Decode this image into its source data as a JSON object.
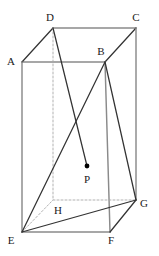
{
  "figure": {
    "type": "geometry-diagram",
    "shape": "rectangular-prism",
    "title": "",
    "canvas": {
      "width": 159,
      "height": 256
    },
    "colors": {
      "solid_edge": "#333333",
      "light_edge": "#8a8a8a",
      "hidden_edge": "#a8a8a8",
      "label_text": "#1a1a1a",
      "background": "#ffffff",
      "point_marker": "#000000"
    },
    "vertices": [
      {
        "name": "A",
        "label": "A",
        "x": 22,
        "y": 62,
        "label_x": 11,
        "label_y": 62,
        "hidden": false
      },
      {
        "name": "B",
        "label": "B",
        "x": 105,
        "y": 62,
        "label_x": 101,
        "label_y": 52,
        "hidden": false
      },
      {
        "name": "C",
        "label": "C",
        "x": 136,
        "y": 28,
        "label_x": 136,
        "label_y": 18,
        "hidden": false
      },
      {
        "name": "D",
        "label": "D",
        "x": 53,
        "y": 28,
        "label_x": 50,
        "label_y": 18,
        "hidden": false
      },
      {
        "name": "E",
        "label": "E",
        "x": 22,
        "y": 232,
        "label_x": 11,
        "label_y": 241,
        "hidden": false
      },
      {
        "name": "F",
        "label": "F",
        "x": 110,
        "y": 232,
        "label_x": 111,
        "label_y": 241,
        "hidden": false
      },
      {
        "name": "G",
        "label": "G",
        "x": 136,
        "y": 200,
        "label_x": 144,
        "label_y": 204,
        "hidden": false
      },
      {
        "name": "H",
        "label": "H",
        "x": 53,
        "y": 200,
        "label_x": 58,
        "label_y": 211,
        "hidden": true
      },
      {
        "name": "P",
        "label": "P",
        "x": 87,
        "y": 166,
        "label_x": 87,
        "label_y": 180,
        "hidden": false,
        "marker": "dot"
      }
    ],
    "edges": [
      {
        "from": "A",
        "to": "B",
        "style": "light"
      },
      {
        "from": "A",
        "to": "D",
        "style": "solid"
      },
      {
        "from": "D",
        "to": "C",
        "style": "light"
      },
      {
        "from": "B",
        "to": "C",
        "style": "solid"
      },
      {
        "from": "A",
        "to": "E",
        "style": "light"
      },
      {
        "from": "B",
        "to": "F",
        "style": "light"
      },
      {
        "from": "C",
        "to": "G",
        "style": "light"
      },
      {
        "from": "D",
        "to": "H",
        "style": "dashed"
      },
      {
        "from": "E",
        "to": "F",
        "style": "light"
      },
      {
        "from": "F",
        "to": "G",
        "style": "solid"
      },
      {
        "from": "H",
        "to": "G",
        "style": "dashed"
      },
      {
        "from": "E",
        "to": "H",
        "style": "dashed"
      },
      {
        "from": "E",
        "to": "B",
        "style": "solid"
      },
      {
        "from": "E",
        "to": "G",
        "style": "solid"
      },
      {
        "from": "B",
        "to": "G",
        "style": "solid"
      },
      {
        "from": "D",
        "to": "P",
        "style": "solid"
      }
    ],
    "interior_point": {
      "name": "P",
      "label": "P",
      "x": 87,
      "y": 166,
      "radius": 2.4
    }
  }
}
